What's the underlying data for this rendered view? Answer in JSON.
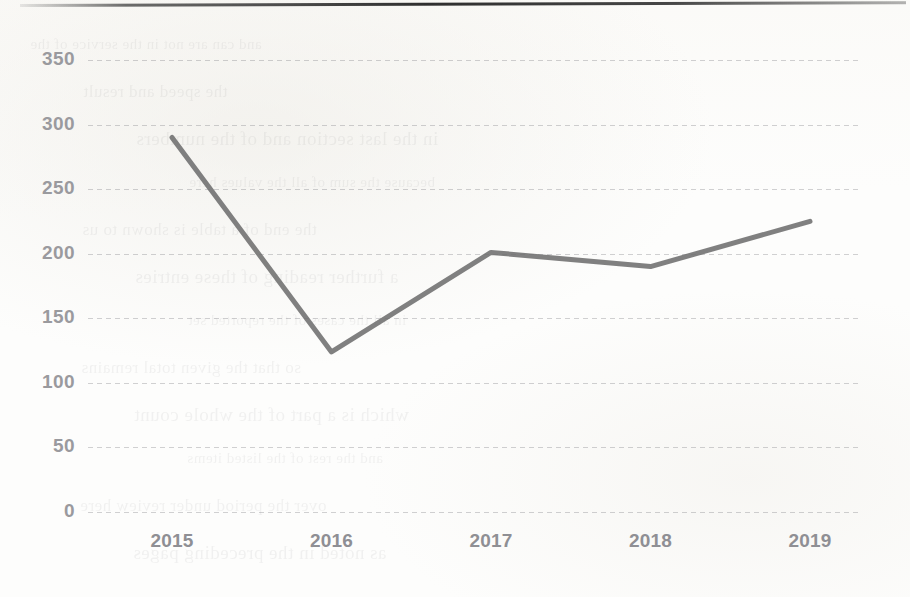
{
  "document": {
    "kind": "scanned-line-chart",
    "background_color": "#fdfdfc",
    "ghost_text_note": "faint reverse-side show-through, illegible"
  },
  "chart_data": {
    "type": "line",
    "title": "",
    "subtitle": "",
    "xlabel": "",
    "ylabel": "",
    "categories": [
      "2015",
      "2016",
      "2017",
      "2018",
      "2019"
    ],
    "values": [
      290,
      124,
      201,
      190,
      225
    ],
    "series": [
      {
        "name": "",
        "values": [
          290,
          124,
          201,
          190,
          225
        ],
        "color": "#6e6e6e",
        "line_width": 5,
        "markers": false
      }
    ],
    "ylim": [
      0,
      350
    ],
    "ytick_labels": [
      "0",
      "50",
      "100",
      "150",
      "200",
      "250",
      "300",
      "350"
    ],
    "ytick_values": [
      0,
      50,
      100,
      150,
      200,
      250,
      300,
      350
    ],
    "xtick_labels": [
      "2015",
      "2016",
      "2017",
      "2018",
      "2019"
    ],
    "grid": true,
    "grid_axis": "y",
    "grid_style": "dotted",
    "grid_color": "#8c8c91",
    "legend": false,
    "legend_position": "none",
    "axis_line": false,
    "tick_label_color": "#9a9a9e"
  },
  "ghost_text": {
    "lines": [
      "and can are not in the service of the",
      "the speed and result",
      "in the last section and of the numbers",
      "because the sum of all the values here",
      "the end of a table is shown to us",
      "a further reading of these entries",
      "in all the cases of the reported set",
      "so that the given total remains",
      "which is a part of the whole count",
      "and the rest of the listed items",
      "over the period under review here",
      "as noted in the preceding pages"
    ]
  }
}
